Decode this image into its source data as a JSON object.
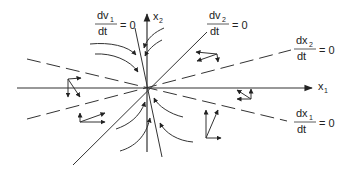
{
  "diagram": {
    "type": "phase-portrait",
    "axes": {
      "x1": {
        "label": "x",
        "subscript": "1"
      },
      "x2": {
        "label": "x",
        "subscript": "2"
      }
    },
    "nullclines": [
      {
        "id": "dv1",
        "num": "dv",
        "num_sub": "1",
        "den": "dt",
        "eq": "= 0",
        "style": "solid"
      },
      {
        "id": "dv2",
        "num": "dv",
        "num_sub": "2",
        "den": "dt",
        "eq": "= 0",
        "style": "solid"
      },
      {
        "id": "dx2",
        "num": "dx",
        "num_sub": "2",
        "den": "dt",
        "eq": "= 0",
        "style": "dashed"
      },
      {
        "id": "dx1",
        "num": "dx",
        "num_sub": "1",
        "den": "dt",
        "eq": "= 0",
        "style": "dashed"
      }
    ],
    "colors": {
      "line": "#333333",
      "background": "#ffffff"
    }
  }
}
